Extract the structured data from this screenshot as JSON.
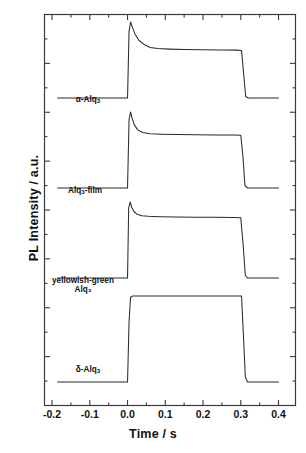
{
  "chart_data": {
    "type": "line",
    "title": "",
    "xlabel": "Time / s",
    "ylabel": "PL Intensity / a.u.",
    "xlim": [
      -0.22,
      0.445
    ],
    "ylim": [
      0,
      4
    ],
    "xticks": [
      -0.2,
      -0.1,
      0.0,
      0.1,
      0.2,
      0.3,
      0.4
    ],
    "xticklabels": [
      "-0.2",
      "-0.1",
      "0.0",
      "0.1",
      "0.2",
      "0.3",
      "0.4"
    ],
    "yticks_labeled": false,
    "y_minor_ticks": 16,
    "grid": false,
    "legend": "inline-curve-labels",
    "line_color": "#2b2b2b",
    "background": "#ffffff",
    "series": [
      {
        "name": "alpha-Alq3",
        "label_html": "&#945;-Alq<sub>3</sub>",
        "label_text": "α-Alq3",
        "baseline": 0.0,
        "pulse_start": 0.0,
        "pulse_end": 0.305,
        "peak": 1.0,
        "plateau": 0.63,
        "decay_tau": 0.022,
        "overshoot": true,
        "points": [
          [
            -0.185,
            0.0
          ],
          [
            -0.02,
            0.0
          ],
          [
            0.0,
            0.0
          ],
          [
            0.004,
            0.88
          ],
          [
            0.008,
            1.0
          ],
          [
            0.013,
            0.93
          ],
          [
            0.02,
            0.84
          ],
          [
            0.03,
            0.76
          ],
          [
            0.045,
            0.7
          ],
          [
            0.06,
            0.665
          ],
          [
            0.08,
            0.65
          ],
          [
            0.11,
            0.643
          ],
          [
            0.15,
            0.638
          ],
          [
            0.2,
            0.634
          ],
          [
            0.25,
            0.632
          ],
          [
            0.29,
            0.63
          ],
          [
            0.302,
            0.625
          ],
          [
            0.308,
            0.3
          ],
          [
            0.313,
            0.02
          ],
          [
            0.32,
            0.0
          ],
          [
            0.37,
            0.0
          ],
          [
            0.4,
            0.0
          ]
        ]
      },
      {
        "name": "Alq3-film",
        "label_html": "Alq<sub>3</sub>-film",
        "label_text": "Alq3-film",
        "baseline": 0.0,
        "pulse_start": 0.0,
        "pulse_end": 0.305,
        "peak": 1.0,
        "plateau": 0.7,
        "decay_tau": 0.016,
        "overshoot": true,
        "points": [
          [
            -0.185,
            0.0
          ],
          [
            -0.02,
            0.0
          ],
          [
            0.0,
            0.0
          ],
          [
            0.004,
            0.9
          ],
          [
            0.008,
            1.0
          ],
          [
            0.012,
            0.92
          ],
          [
            0.018,
            0.83
          ],
          [
            0.027,
            0.765
          ],
          [
            0.04,
            0.73
          ],
          [
            0.06,
            0.715
          ],
          [
            0.09,
            0.708
          ],
          [
            0.13,
            0.703
          ],
          [
            0.18,
            0.7
          ],
          [
            0.23,
            0.698
          ],
          [
            0.28,
            0.697
          ],
          [
            0.3,
            0.695
          ],
          [
            0.306,
            0.4
          ],
          [
            0.311,
            0.03
          ],
          [
            0.318,
            0.0
          ],
          [
            0.37,
            0.0
          ],
          [
            0.4,
            0.0
          ]
        ]
      },
      {
        "name": "yellowish-green Alq3",
        "label_html": "yellowish-green<br>Alq<sub>3</sub>",
        "label_text": "yellowish-green Alq3",
        "baseline": 0.0,
        "pulse_start": 0.0,
        "pulse_end": 0.305,
        "peak": 1.0,
        "plateau": 0.8,
        "decay_tau": 0.014,
        "overshoot": true,
        "points": [
          [
            -0.185,
            0.0
          ],
          [
            -0.02,
            0.0
          ],
          [
            0.0,
            0.0
          ],
          [
            0.003,
            0.92
          ],
          [
            0.007,
            1.0
          ],
          [
            0.011,
            0.93
          ],
          [
            0.017,
            0.875
          ],
          [
            0.025,
            0.84
          ],
          [
            0.038,
            0.82
          ],
          [
            0.055,
            0.812
          ],
          [
            0.085,
            0.806
          ],
          [
            0.13,
            0.802
          ],
          [
            0.18,
            0.8
          ],
          [
            0.23,
            0.798
          ],
          [
            0.28,
            0.796
          ],
          [
            0.3,
            0.794
          ],
          [
            0.306,
            0.45
          ],
          [
            0.312,
            0.04
          ],
          [
            0.318,
            0.0
          ],
          [
            0.37,
            0.0
          ],
          [
            0.4,
            0.0
          ]
        ]
      },
      {
        "name": "delta-Alq3",
        "label_html": "&#948;-Alq<sub>3</sub>",
        "label_text": "δ-Alq3",
        "baseline": 0.0,
        "pulse_start": 0.0,
        "pulse_end": 0.305,
        "peak": 1.0,
        "plateau": 1.0,
        "decay_tau": 0,
        "overshoot": false,
        "points": [
          [
            -0.185,
            0.0
          ],
          [
            -0.02,
            0.0
          ],
          [
            0.0,
            0.0
          ],
          [
            0.004,
            0.7
          ],
          [
            0.008,
            0.985
          ],
          [
            0.014,
            1.0
          ],
          [
            0.03,
            1.0
          ],
          [
            0.06,
            1.0
          ],
          [
            0.1,
            1.0
          ],
          [
            0.15,
            1.0
          ],
          [
            0.2,
            1.0
          ],
          [
            0.25,
            1.0
          ],
          [
            0.29,
            1.0
          ],
          [
            0.302,
            1.0
          ],
          [
            0.307,
            0.55
          ],
          [
            0.312,
            0.06
          ],
          [
            0.318,
            0.0
          ],
          [
            0.37,
            0.0
          ],
          [
            0.4,
            0.0
          ]
        ]
      }
    ]
  },
  "axes": {
    "x_title": "Time / s",
    "y_title": "PL Intensity / a.u.",
    "x_tick_labels": [
      "-0.2",
      "-0.1",
      "0.0",
      "0.1",
      "0.2",
      "0.3",
      "0.4"
    ]
  },
  "curve_labels": [
    {
      "line1": "α-Alq",
      "sub1": "3",
      "line2": ""
    },
    {
      "line1": "Alq",
      "sub1": "3",
      "line2": "-film"
    },
    {
      "line1": "yellowish-green",
      "sub1": "",
      "line2": "Alq₃"
    },
    {
      "line1": "δ-Alq",
      "sub1": "3",
      "line2": ""
    }
  ]
}
